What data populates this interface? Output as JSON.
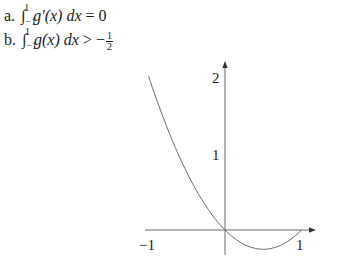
{
  "statements": [
    {
      "label": "a.",
      "integral": "∫",
      "lower": "−1",
      "upper": "1",
      "integrand": "g′(x) dx",
      "relation": "= 0"
    },
    {
      "label": "b.",
      "integral": "∫",
      "lower": "−1",
      "upper": "1",
      "integrand": "g(x) dx",
      "relation": "> −",
      "frac_num": "1",
      "frac_den": "2"
    }
  ],
  "chart_data": {
    "type": "line",
    "title": "",
    "xlabel": "",
    "ylabel": "",
    "function": "g(x) = x^2 - x",
    "x": [
      -1,
      -0.75,
      -0.5,
      -0.25,
      0,
      0.25,
      0.5,
      0.75,
      1
    ],
    "series": [
      {
        "name": "g(x)",
        "values": [
          2,
          1.3125,
          0.75,
          0.3125,
          0,
          -0.1875,
          -0.25,
          -0.1875,
          0
        ]
      }
    ],
    "x_tick_labels": [
      "−1",
      "1"
    ],
    "y_tick_labels": [
      "1",
      "2"
    ],
    "xlim": [
      -1,
      1
    ],
    "ylim": [
      -0.25,
      2
    ],
    "grid": false,
    "colors": {
      "axis": "#555555",
      "curve": "#666666",
      "text": "#1a1a1a"
    }
  }
}
